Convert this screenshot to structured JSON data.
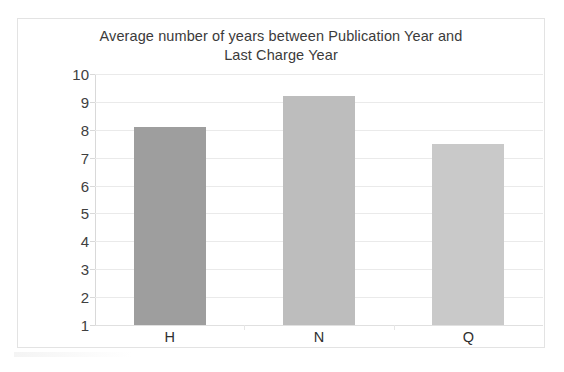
{
  "chart_data": {
    "type": "bar",
    "title": "Average number of years between Publication Year and Last Charge Year",
    "title_lines": [
      "Average number of years between Publication Year and",
      "Last Charge Year"
    ],
    "categories": [
      "H",
      "N",
      "Q"
    ],
    "values": [
      8.1,
      9.2,
      7.5
    ],
    "series": [
      {
        "name": "Average years",
        "values": [
          8.1,
          9.2,
          7.5
        ]
      }
    ],
    "xlabel": "",
    "ylabel": "",
    "ylim": [
      1,
      10
    ],
    "y_ticks": [
      10,
      9,
      8,
      7,
      6,
      5,
      4,
      3,
      2,
      1
    ],
    "y_tick_labels": [
      "10",
      "9",
      "8",
      "7",
      "6",
      "5",
      "4",
      "3",
      "2",
      "1"
    ],
    "grid": true,
    "legend": false,
    "legend_position": "none",
    "bar_colors": [
      "#9e9e9e",
      "#bdbdbd",
      "#c9c9c9"
    ],
    "colors": {
      "plot_background": "#ffffff",
      "frame_border": "#e3e3e3",
      "gridline": "#eaeaea",
      "axis_line": "#d9d9d9",
      "title_text": "#3b3b3b",
      "tick_text": "#404040",
      "category_text": "#2f2f2f"
    }
  }
}
